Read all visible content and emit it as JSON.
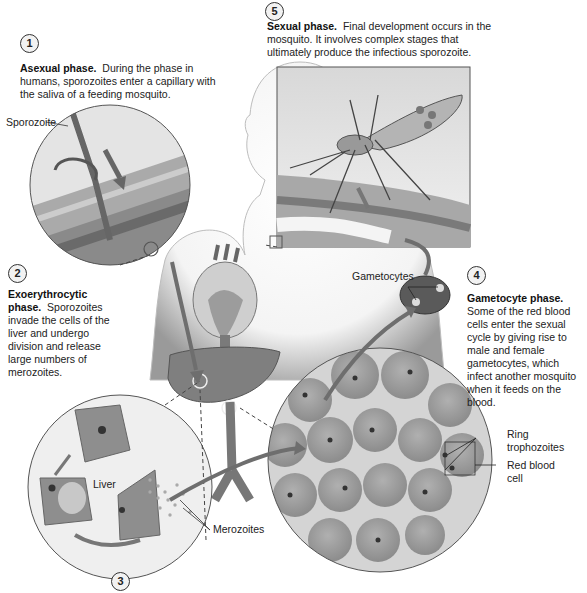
{
  "diagram": {
    "steps": [
      {
        "number": "1",
        "heading": "Asexual phase.",
        "text": "During the phase in humans, sporozoites enter a capillary with the saliva of a feeding mosquito."
      },
      {
        "number": "2",
        "heading": "Exoerythrocytic phase.",
        "text": "Sporozoites invade the cells of the liver and undergo division and release large numbers of merozoites."
      },
      {
        "number": "3",
        "heading": "",
        "text": ""
      },
      {
        "number": "4",
        "heading": "Gametocyte phase.",
        "text": "Some of the red blood cells enter the sexual cycle by giving rise to male and female gametocytes, which infect another mosquito when it feeds on the blood."
      },
      {
        "number": "5",
        "heading": "Sexual phase.",
        "text": "Final development occurs in the mosquito. It involves complex stages that ultimately produce the infectious sporozoite."
      }
    ],
    "labels": {
      "sporozoite": "Sporozoite",
      "liver": "Liver",
      "merozoites": "Merozoites",
      "gametocytes": "Gametocytes",
      "ring_trophozoites_1": "Ring",
      "ring_trophozoites_2": "trophozoites",
      "red_blood_cell_1": "Red blood",
      "red_blood_cell_2": "cell"
    },
    "colors": {
      "skin_gray": "#d9d9d9",
      "tissue": "#8a8a8a",
      "blood_cell": "#9a9a9a",
      "arrow": "#6e6e6e",
      "outline": "#444444"
    }
  }
}
